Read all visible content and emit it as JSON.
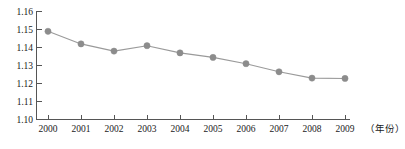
{
  "chart_data": {
    "type": "line",
    "title": "",
    "subtitle": "",
    "xlabel": "（年份）",
    "ylabel": "",
    "categories": [
      "2000",
      "2001",
      "2002",
      "2003",
      "2004",
      "2005",
      "2006",
      "2007",
      "2008",
      "2009"
    ],
    "x": [
      2000,
      2001,
      2002,
      2003,
      2004,
      2005,
      2006,
      2007,
      2008,
      2009
    ],
    "values": [
      1.149,
      1.142,
      1.138,
      1.141,
      1.137,
      1.1345,
      1.131,
      1.1265,
      1.123,
      1.1228
    ],
    "series": [
      {
        "name": "",
        "values": [
          1.149,
          1.142,
          1.138,
          1.141,
          1.137,
          1.1345,
          1.131,
          1.1265,
          1.123,
          1.1228
        ]
      }
    ],
    "ylim": [
      1.1,
      1.16
    ],
    "xlim": [
      1999.5,
      2009.6
    ],
    "yticks": [
      1.1,
      1.11,
      1.12,
      1.13,
      1.14,
      1.15,
      1.16
    ],
    "ytick_labels": [
      "1.10",
      "1.11",
      "1.12",
      "1.13",
      "1.14",
      "1.15",
      "1.16"
    ],
    "xtick_labels": [
      "2000",
      "2001",
      "2002",
      "2003",
      "2004",
      "2005",
      "2006",
      "2007",
      "2008",
      "2009"
    ],
    "grid": false,
    "legend": false,
    "legend_position": "none",
    "marker": "circle",
    "marker_color": "#8c8c8c",
    "line_color": "#9a9a9a",
    "axis_color": "#555555",
    "background_color": "#ffffff",
    "annotations": []
  },
  "axis": {
    "x_axis_label": "（年份）"
  }
}
